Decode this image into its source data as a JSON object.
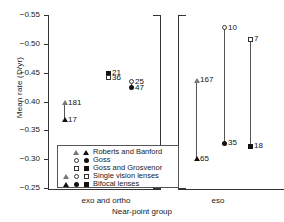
{
  "chart_data": {
    "type": "scatter",
    "title": "",
    "xlabel": "Near-point group",
    "ylabel": "Mean rate (D/yr)",
    "ylim": [
      -0.25,
      -0.55
    ],
    "yticks": [
      "-0.55",
      "-0.50",
      "-0.45",
      "-0.40",
      "-0.35",
      "-0.30",
      "-0.25"
    ],
    "grid": false,
    "legend_position": "lower-left",
    "panels": [
      {
        "name": "exo and ortho",
        "label": "exo and ortho",
        "points": [
          {
            "label": "181",
            "value": -0.398,
            "marker": "triangle-open",
            "series": "Roberts and Banford / Single vision lenses"
          },
          {
            "label": "17",
            "value": -0.368,
            "marker": "triangle-filled",
            "series": "Roberts and Banford / Bifocal lenses"
          },
          {
            "label": "21",
            "value": -0.449,
            "marker": "square-filled",
            "series": "Goss and Grosvenor / Bifocal lenses"
          },
          {
            "label": "36",
            "value": -0.441,
            "marker": "square-open",
            "series": "Goss and Grosvenor / Single vision lenses"
          },
          {
            "label": "25",
            "value": -0.434,
            "marker": "circle-open",
            "series": "Goss / Single vision lenses"
          },
          {
            "label": "47",
            "value": -0.424,
            "marker": "circle-filled",
            "series": "Goss / Bifocal lenses"
          }
        ],
        "connectors": [
          [
            "181",
            "17"
          ],
          [
            "25",
            "47"
          ]
        ]
      },
      {
        "name": "eso",
        "label": "eso",
        "points": [
          {
            "label": "167",
            "value": -0.437,
            "marker": "triangle-open",
            "series": "Roberts and Banford / Single vision lenses"
          },
          {
            "label": "65",
            "value": -0.301,
            "marker": "triangle-filled",
            "series": "Roberts and Banford / Bifocal lenses"
          },
          {
            "label": "10",
            "value": -0.528,
            "marker": "circle-open",
            "series": "Goss / Single vision lenses"
          },
          {
            "label": "35",
            "value": -0.328,
            "marker": "circle-filled",
            "series": "Goss / Bifocal lenses"
          },
          {
            "label": "7",
            "value": -0.508,
            "marker": "square-open",
            "series": "Goss and Grosvenor / Single vision lenses"
          },
          {
            "label": "18",
            "value": -0.322,
            "marker": "square-filled",
            "series": "Goss and Grosvenor / Bifocal lenses"
          }
        ],
        "connectors": [
          [
            "167",
            "65"
          ],
          [
            "10",
            "35"
          ],
          [
            "7",
            "18"
          ]
        ]
      }
    ],
    "legend": {
      "column_headers": [
        "triangle",
        "circle",
        "square"
      ],
      "rows": [
        {
          "label": "Roberts and Banford",
          "symbols": [
            "",
            "triangle-open",
            "triangle-filled"
          ]
        },
        {
          "label": "Goss",
          "symbols": [
            "",
            "circle-open",
            "circle-filled"
          ]
        },
        {
          "label": "Goss and Grosvenor",
          "symbols": [
            "",
            "square-open",
            "square-filled"
          ]
        },
        {
          "label": "Single vision lenses",
          "symbols": [
            "triangle-open",
            "circle-open",
            "square-open"
          ]
        },
        {
          "label": "Bifocal lenses",
          "symbols": [
            "triangle-filled",
            "circle-filled",
            "square-filled"
          ]
        }
      ]
    }
  },
  "colors": {
    "axis": "#333333",
    "marker_filled": "#111111",
    "marker_open_edge": "#333333",
    "background": "#ffffff"
  }
}
